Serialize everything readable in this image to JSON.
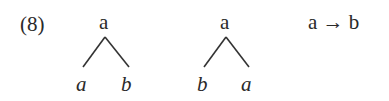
{
  "example": {
    "number": "(8)",
    "tree1": {
      "root": "a",
      "left": "a",
      "right": "b"
    },
    "tree2": {
      "root": "a",
      "left": "b",
      "right": "a"
    },
    "relation": "a → b"
  }
}
